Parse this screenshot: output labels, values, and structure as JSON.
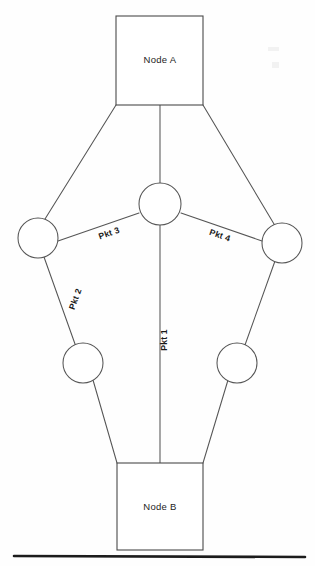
{
  "diagram": {
    "background_color": "#fefefe",
    "line_color": "#555555",
    "text_color": "#1a1a1a",
    "baseline_color": "#1c1c1c",
    "nodes": [
      {
        "id": "node-a",
        "label": "Node A",
        "shape": "rect",
        "x": 116,
        "y": 16,
        "width": 87,
        "height": 89,
        "label_x": 160,
        "label_y": 63
      },
      {
        "id": "node-b",
        "label": "Node B",
        "shape": "rect",
        "x": 117,
        "y": 463,
        "width": 86,
        "height": 87,
        "label_x": 160,
        "label_y": 510
      }
    ],
    "relays": [
      {
        "id": "relay-center",
        "cx": 160,
        "cy": 204,
        "r": 21
      },
      {
        "id": "relay-left",
        "cx": 38,
        "cy": 238,
        "r": 20
      },
      {
        "id": "relay-right",
        "cx": 282,
        "cy": 243,
        "r": 20
      },
      {
        "id": "relay-lower-left",
        "cx": 83,
        "cy": 363,
        "r": 20
      },
      {
        "id": "relay-lower-right",
        "cx": 237,
        "cy": 363,
        "r": 20
      }
    ],
    "links": [
      {
        "id": "link-a-to-center",
        "x1": 160,
        "y1": 105,
        "x2": 160,
        "y2": 183
      },
      {
        "id": "link-a-to-left",
        "x1": 116,
        "y1": 105,
        "x2": 45,
        "y2": 219
      },
      {
        "id": "link-a-to-right",
        "x1": 203,
        "y1": 105,
        "x2": 274,
        "y2": 224
      },
      {
        "id": "link-center-to-left",
        "x1": 139,
        "y1": 213,
        "x2": 58,
        "y2": 241
      },
      {
        "id": "link-center-to-right",
        "x1": 181,
        "y1": 213,
        "x2": 262,
        "y2": 241
      },
      {
        "id": "link-left-to-lowerleft",
        "x1": 44,
        "y1": 257,
        "x2": 75,
        "y2": 344
      },
      {
        "id": "link-right-to-lowerright",
        "x1": 275,
        "y1": 261,
        "x2": 245,
        "y2": 345
      },
      {
        "id": "link-center-to-b",
        "x1": 160,
        "y1": 225,
        "x2": 160,
        "y2": 463
      },
      {
        "id": "link-lowerleft-to-b",
        "x1": 93,
        "y1": 380,
        "x2": 117,
        "y2": 463
      },
      {
        "id": "link-lowerright-to-b",
        "x1": 228,
        "y1": 380,
        "x2": 203,
        "y2": 463
      }
    ],
    "packet_labels": [
      {
        "id": "pkt-1",
        "text": "Pkt 1",
        "x": 167,
        "y": 340,
        "rotation": -90
      },
      {
        "id": "pkt-2",
        "text": "Pkt 2",
        "x": 78,
        "y": 300,
        "rotation": -70
      },
      {
        "id": "pkt-3",
        "text": "Pkt 3",
        "x": 110,
        "y": 236,
        "rotation": -19
      },
      {
        "id": "pkt-4",
        "text": "Pkt 4",
        "x": 219,
        "y": 238,
        "rotation": 19
      }
    ],
    "baseline": {
      "id": "bottom-rule",
      "x1": 14,
      "y1": 556,
      "x2": 305,
      "y2": 557
    }
  }
}
